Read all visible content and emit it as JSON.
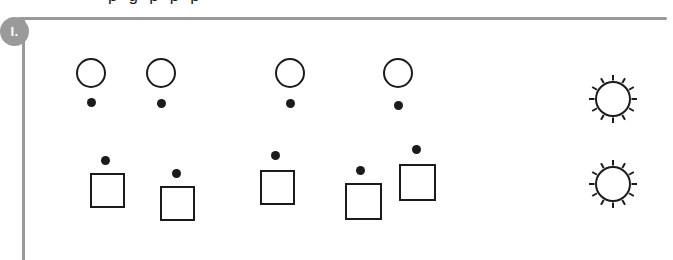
{
  "page": {
    "width": 673,
    "height": 260,
    "background_color": "#ffffff",
    "ink_color": "#1b1b1b",
    "rule_color": "#9a9a9a"
  },
  "clipped_header": {
    "text": "p g p p p",
    "note": "row of text clipped at top edge, only descenders visible"
  },
  "section_marker": {
    "label": "I.",
    "shape": "circle-badge",
    "background_color": "#9a9a9a",
    "text_color": "#ffffff"
  },
  "rules": {
    "horizontal": {
      "x": 18,
      "y": 17,
      "width": 649,
      "thickness": 3
    },
    "vertical": {
      "x": 22,
      "y": 19,
      "height": 241,
      "thickness": 3
    }
  },
  "rows": [
    {
      "name": "circle-row",
      "shape": "circle",
      "dot_position": "below",
      "count": 4,
      "items": [
        {
          "shape_x": 76,
          "shape_y": 58,
          "size": 30,
          "dot_x": 87,
          "dot_y": 98
        },
        {
          "shape_x": 146,
          "shape_y": 58,
          "size": 30,
          "dot_x": 157,
          "dot_y": 99
        },
        {
          "shape_x": 275,
          "shape_y": 58,
          "size": 30,
          "dot_x": 286,
          "dot_y": 99
        },
        {
          "shape_x": 383,
          "shape_y": 58,
          "size": 30,
          "dot_x": 394,
          "dot_y": 101
        }
      ]
    },
    {
      "name": "square-row",
      "shape": "square",
      "dot_position": "above",
      "count": 5,
      "items": [
        {
          "shape_x": 90,
          "shape_y": 173,
          "size": 35,
          "dot_x": 101,
          "dot_y": 156
        },
        {
          "shape_x": 160,
          "shape_y": 186,
          "size": 35,
          "dot_x": 172,
          "dot_y": 169
        },
        {
          "shape_x": 260,
          "shape_y": 170,
          "size": 35,
          "dot_x": 271,
          "dot_y": 151
        },
        {
          "shape_x": 345,
          "shape_y": 183,
          "size": 37,
          "dot_x": 356,
          "dot_y": 166
        },
        {
          "shape_x": 399,
          "shape_y": 164,
          "size": 37,
          "dot_x": 412,
          "dot_y": 145
        }
      ]
    }
  ],
  "sun_glyphs": {
    "name": "sun-burst",
    "count": 2,
    "ray_count": 12,
    "items": [
      {
        "center_x": 613,
        "center_y": 99,
        "radius": 17
      },
      {
        "center_x": 613,
        "center_y": 184,
        "radius": 17
      }
    ]
  }
}
